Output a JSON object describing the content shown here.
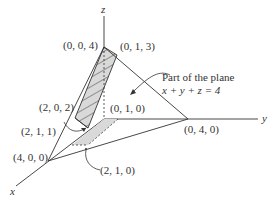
{
  "figure": {
    "axes": {
      "x": "x",
      "y": "y",
      "z": "z"
    },
    "points": {
      "p004": "(0, 0, 4)",
      "p013": "(0, 1, 3)",
      "p202": "(2, 0, 2)",
      "p010": "(0, 1, 0)",
      "p211": "(2, 1, 1)",
      "p400": "(4, 0, 0)",
      "p040": "(0, 4, 0)",
      "p210": "(2, 1, 0)"
    },
    "annotation": {
      "line1": "Part of the plane",
      "line2": "x + y + z = 4"
    },
    "colors": {
      "stroke": "#333333",
      "fill": "#d9d9d9"
    }
  }
}
